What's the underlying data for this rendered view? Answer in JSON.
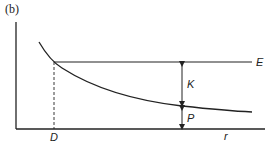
{
  "panel_label": "(b)",
  "labels": {
    "horizontal_line": "E",
    "upper_gap": "K",
    "lower_gap": "P",
    "x_marker": "D",
    "x_axis": "r"
  },
  "colors": {
    "line": "#222222",
    "background": "#ffffff"
  }
}
